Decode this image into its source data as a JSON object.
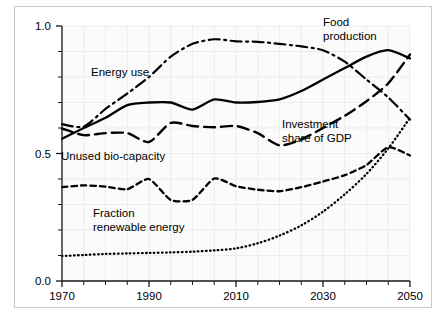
{
  "chart_data": {
    "type": "line",
    "title": "",
    "subtitle": "",
    "xlabel": "",
    "ylabel": "",
    "xlim": [
      1970,
      2050
    ],
    "ylim": [
      0.0,
      1.0
    ],
    "grid": true,
    "legend_position": "inline-annotations",
    "x_ticks": [
      "1970",
      "1990",
      "2010",
      "2030",
      "2050"
    ],
    "x_tick_values": [
      1970,
      1990,
      2010,
      2030,
      2050
    ],
    "x_minor_step": 5,
    "y_ticks": [
      "0.0",
      "0.5",
      "1.0"
    ],
    "y_tick_values": [
      0.0,
      0.5,
      1.0
    ],
    "y_minor_step": 0.1,
    "x": [
      1970,
      1975,
      1980,
      1985,
      1990,
      1995,
      2000,
      2005,
      2010,
      2015,
      2020,
      2025,
      2030,
      2035,
      2040,
      2045,
      2050
    ],
    "series": [
      {
        "name": "Energy use",
        "style": "dash-dot",
        "label": "Energy use",
        "values": [
          0.615,
          0.605,
          0.675,
          0.735,
          0.8,
          0.88,
          0.93,
          0.948,
          0.94,
          0.938,
          0.93,
          0.92,
          0.905,
          0.86,
          0.79,
          0.72,
          0.633
        ]
      },
      {
        "name": "Food production",
        "style": "solid",
        "label": "Food production",
        "values": [
          0.558,
          0.6,
          0.64,
          0.69,
          0.7,
          0.7,
          0.672,
          0.712,
          0.7,
          0.702,
          0.712,
          0.745,
          0.79,
          0.835,
          0.88,
          0.905,
          0.873
        ]
      },
      {
        "name": "Investment share of GDP",
        "style": "long-dash",
        "label": "Investment share of GDP",
        "values": [
          0.598,
          0.572,
          0.58,
          0.58,
          0.545,
          0.62,
          0.608,
          0.603,
          0.608,
          0.58,
          0.532,
          0.555,
          0.6,
          0.648,
          0.705,
          0.775,
          0.888
        ]
      },
      {
        "name": "Unused bio-capacity",
        "style": "short-dash",
        "label": "Unused bio-capacity",
        "values": [
          0.368,
          0.375,
          0.37,
          0.36,
          0.4,
          0.318,
          0.318,
          0.402,
          0.372,
          0.358,
          0.352,
          0.368,
          0.39,
          0.415,
          0.455,
          0.525,
          0.492
        ]
      },
      {
        "name": "Fraction renewable energy",
        "style": "dotted",
        "label": "Fraction renewable energy",
        "values": [
          0.098,
          0.102,
          0.106,
          0.108,
          0.11,
          0.112,
          0.115,
          0.12,
          0.128,
          0.148,
          0.178,
          0.218,
          0.272,
          0.34,
          0.42,
          0.52,
          0.64
        ]
      }
    ],
    "annotations": [
      {
        "id": "energy-use",
        "text": "Energy use",
        "lines": [
          "Energy use"
        ],
        "x_px": 91,
        "y_px": 76
      },
      {
        "id": "food-production",
        "text": "Food production",
        "lines": [
          "Food",
          "production"
        ],
        "x_px": 323,
        "y_px": 26
      },
      {
        "id": "investment-share",
        "text": "Investment share of GDP",
        "lines": [
          "Investment",
          "share of GDP"
        ],
        "x_px": 282,
        "y_px": 128
      },
      {
        "id": "unused-biocapacity",
        "text": "Unused bio-capacity",
        "lines": [
          "Unused bio-capacity"
        ],
        "x_px": 61,
        "y_px": 160
      },
      {
        "id": "fraction-renewable",
        "text": "Fraction renewable energy",
        "lines": [
          "Fraction",
          "renewable energy"
        ],
        "x_px": 93,
        "y_px": 217
      }
    ],
    "colors": {
      "line": "#000000",
      "axis": "#1a1a1a",
      "grid": "#e6e6e6",
      "plot_background": "#fbfbfb",
      "page_background": "#ffffff",
      "frame": "#c9c9c9"
    }
  }
}
